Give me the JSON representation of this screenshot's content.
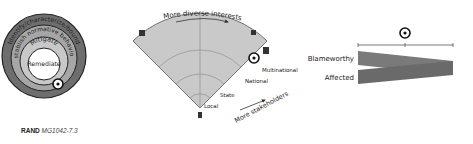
{
  "rings": {
    "labels": [
      "Identify/characterize/bound",
      "Establish normative behaviors",
      "Mitigate",
      "Remediate"
    ],
    "colors": [
      "#6e6e6e",
      "#a6a6a6",
      "#c8c8c8",
      "#ffffff"
    ]
  },
  "fan": {
    "top_label": "More diverse interests",
    "bottom_label": "More stakeholders",
    "levels": [
      "Local",
      "State",
      "National",
      "Multinational"
    ],
    "fill": "#c9c9c9"
  },
  "bars": {
    "top_label": "Blameworthy",
    "bottom_label": "Affected",
    "color": "#7a7a7a"
  },
  "caption": {
    "org": "RAND",
    "id": "MG1042-7.3"
  }
}
